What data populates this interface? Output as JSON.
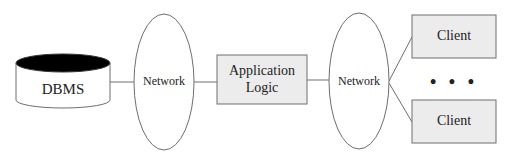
{
  "diagram": {
    "type": "three-tier architecture",
    "nodes": {
      "dbms": {
        "label": "DBMS",
        "shape": "cylinder"
      },
      "network_1": {
        "label": "Network",
        "shape": "ellipse"
      },
      "application_logic": {
        "label": "Application\nLogic",
        "shape": "rectangle"
      },
      "network_2": {
        "label": "Network",
        "shape": "ellipse"
      },
      "client_1": {
        "label": "Client",
        "shape": "rectangle"
      },
      "ellipsis": {
        "label": "• • •"
      },
      "client_2": {
        "label": "Client",
        "shape": "rectangle"
      }
    },
    "edges": [
      {
        "from": "dbms",
        "to": "network_1"
      },
      {
        "from": "network_1",
        "to": "application_logic"
      },
      {
        "from": "application_logic",
        "to": "network_2"
      },
      {
        "from": "network_2",
        "to": "client_1"
      },
      {
        "from": "network_2",
        "to": "client_2"
      }
    ],
    "colors": {
      "stroke": "#6e6e6e",
      "box_fill": "#ececec",
      "cylinder_top_fill": "#000000",
      "background": "#ffffff"
    }
  }
}
